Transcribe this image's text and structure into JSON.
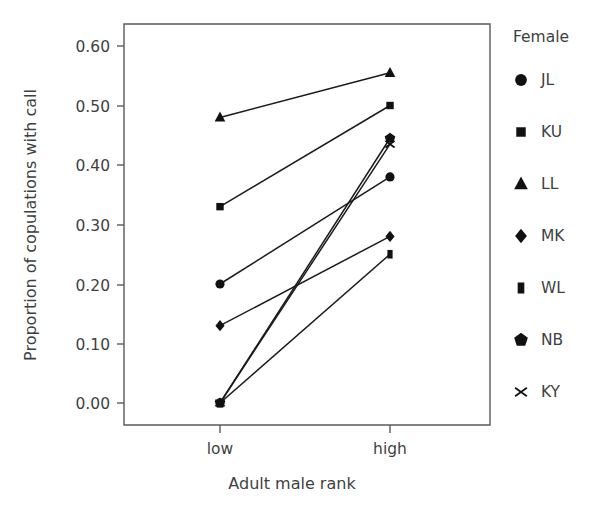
{
  "chart_data": {
    "type": "line",
    "title": "",
    "xlabel": "Adult male rank",
    "ylabel": "Proportion of copulations with call",
    "categories": [
      "low",
      "high"
    ],
    "x_tick_labels": [
      "low",
      "high"
    ],
    "y_tick_labels": [
      "0.00",
      "0.10",
      "0.20",
      "0.30",
      "0.40",
      "0.50",
      "0.60"
    ],
    "y_ticks": [
      0.0,
      0.1,
      0.2,
      0.3,
      0.4,
      0.5,
      0.6
    ],
    "ylim": [
      -0.025,
      0.635
    ],
    "grid": false,
    "legend_position": "right",
    "legend_title": "Female",
    "series": [
      {
        "name": "JL",
        "marker": "circle",
        "values": [
          0.2,
          0.38
        ]
      },
      {
        "name": "KU",
        "marker": "square",
        "values": [
          0.33,
          0.5
        ]
      },
      {
        "name": "LL",
        "marker": "triangle",
        "values": [
          0.48,
          0.555
        ]
      },
      {
        "name": "MK",
        "marker": "diamond",
        "values": [
          0.13,
          0.28
        ]
      },
      {
        "name": "WL",
        "marker": "rectangle",
        "values": [
          0.0,
          0.25
        ]
      },
      {
        "name": "NB",
        "marker": "pentagon",
        "values": [
          0.0,
          0.445
        ]
      },
      {
        "name": "KY",
        "marker": "cross",
        "values": [
          0.0,
          0.435
        ]
      }
    ]
  },
  "legend": {
    "title": "Female",
    "entries": [
      {
        "label": "JL",
        "marker": "circle"
      },
      {
        "label": "KU",
        "marker": "square"
      },
      {
        "label": "LL",
        "marker": "triangle"
      },
      {
        "label": "MK",
        "marker": "diamond"
      },
      {
        "label": "WL",
        "marker": "rectangle"
      },
      {
        "label": "NB",
        "marker": "pentagon"
      },
      {
        "label": "KY",
        "marker": "cross"
      }
    ]
  },
  "axes": {
    "y_title": "Proportion of copulations with call",
    "x_title": "Adult male rank",
    "y_tick_labels": [
      "0.60",
      "0.50",
      "0.40",
      "0.30",
      "0.20",
      "0.10",
      "0.00"
    ],
    "x_tick_labels": [
      "low",
      "high"
    ]
  },
  "colors": {
    "marker": "#111111",
    "line": "#1a1a1a",
    "axis": "#5a5a5a",
    "text": "#3f3f3f",
    "background": "#ffffff"
  }
}
